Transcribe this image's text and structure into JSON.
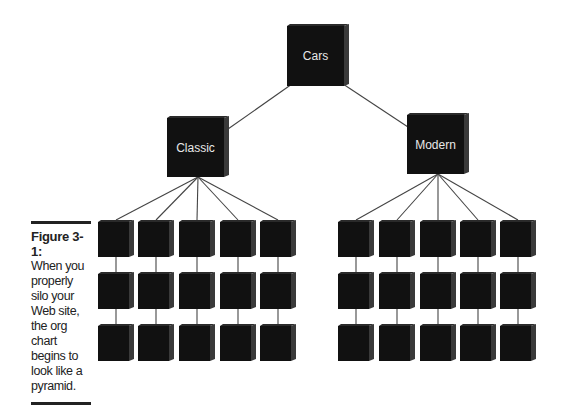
{
  "diagram": {
    "root": {
      "label": "Cars"
    },
    "branches": [
      {
        "label": "Classic",
        "grid": {
          "columns": 5,
          "rows": 3
        }
      },
      {
        "label": "Modern",
        "grid": {
          "columns": 5,
          "rows": 3
        }
      }
    ],
    "colors": {
      "box": "#111111",
      "box_side": "#3a3a3a",
      "line": "#444444",
      "label": "#e8e8e8"
    }
  },
  "caption": {
    "figure_label": "Figure 3-1:",
    "text": "When you properly silo your Web site, the org chart begins to look like a pyramid."
  }
}
